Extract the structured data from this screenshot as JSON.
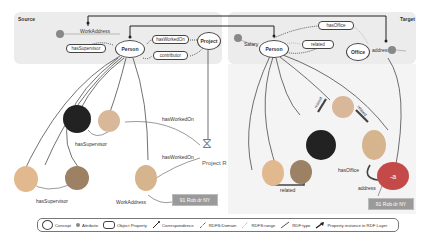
{
  "source_panel": {
    "title": "Source",
    "concepts": [
      "Person",
      "Project"
    ],
    "object_properties": [
      "hasSupervisor",
      "hasWorkedOn",
      "contributor"
    ],
    "attributes": [
      {
        "label": "WorkAddress"
      }
    ]
  },
  "target_panel": {
    "title": "Target",
    "concepts": [
      "Person",
      "Office"
    ],
    "object_properties": [
      "hasOffice",
      "related"
    ],
    "attributes": [
      {
        "label": "Salary"
      },
      {
        "label": "address"
      }
    ]
  },
  "instance_layer": {
    "left": {
      "edge_labels": [
        "hasWorkedOn",
        "hasWorkedOn",
        "hasSupervisor",
        "hasSupervisor",
        "WorkAddress"
      ],
      "project_label": "Project R",
      "literal": "91 Rob dr NY"
    },
    "right": {
      "edge_labels": [
        "related",
        "related",
        "related",
        "hasOffice",
        "address"
      ],
      "office_label": "-a",
      "literal": "91 Rob dr NY"
    }
  },
  "legend": {
    "items": [
      {
        "icon": "concept-ellipse",
        "label": "Concept"
      },
      {
        "icon": "attribute-dot",
        "label": "Attribute"
      },
      {
        "icon": "object-property-box",
        "label": "Object Property"
      },
      {
        "icon": "correspondence-line",
        "label": "Correspondence"
      },
      {
        "icon": "rdfs-domain-line",
        "label": "RDFS:Domain"
      },
      {
        "icon": "rdfs-range-line",
        "label": "RDFS:range"
      },
      {
        "icon": "rdf-type-line",
        "label": "RDF:type"
      },
      {
        "icon": "property-instance-arrow",
        "label": "Property instance in RDF Layer"
      }
    ]
  },
  "colors": {
    "panel_bg": "#ececec",
    "attribute_dot": "#888888",
    "literal_bg": "#9a9a9a",
    "office_instance": "#c44a4a",
    "line": "#333333"
  }
}
